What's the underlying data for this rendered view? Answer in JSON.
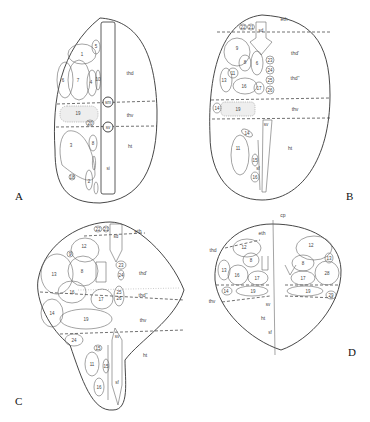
{
  "figure": {
    "panels": [
      {
        "id": "A",
        "label": "A",
        "regions": [
          "thd",
          "thv",
          "ht"
        ],
        "midline_labels": [
          "sm",
          "sv",
          "si"
        ],
        "numbered_structures": [
          "1",
          "2",
          "3",
          "4",
          "5",
          "6",
          "7",
          "8",
          "9",
          "10",
          "18",
          "19",
          "20",
          "2",
          "3",
          "7"
        ]
      },
      {
        "id": "B",
        "label": "B",
        "regions": [
          "eth",
          "thd'",
          "thd''",
          "thv",
          "ht"
        ],
        "midline_labels": [
          "sd",
          "sv",
          "sf"
        ],
        "numbered_structures": [
          "22",
          "21",
          "9",
          "8",
          "6",
          "23",
          "24",
          "11",
          "13",
          "16",
          "17",
          "25",
          "26",
          "14",
          "19",
          "14",
          "11",
          "15",
          "16"
        ]
      },
      {
        "id": "C",
        "label": "C",
        "regions": [
          "eth",
          "thd'",
          "thd''",
          "thv",
          "ht"
        ],
        "midline_labels": [
          "sd",
          "sv",
          "sf"
        ],
        "numbered_structures": [
          "22",
          "21",
          "12",
          "9",
          "8",
          "13",
          "16",
          "17",
          "23",
          "24",
          "25",
          "26",
          "14",
          "19",
          "24",
          "15",
          "11",
          "15",
          "16"
        ]
      },
      {
        "id": "D",
        "label": "D",
        "regions": [
          "eth",
          "thd",
          "thv",
          "ht"
        ],
        "midline_labels": [
          "cp",
          "sv",
          "sf"
        ],
        "numbered_structures": [
          "12",
          "8",
          "13",
          "16",
          "17",
          "14",
          "19",
          "12",
          "8",
          "13",
          "17",
          "28",
          "19",
          "29"
        ]
      }
    ]
  }
}
